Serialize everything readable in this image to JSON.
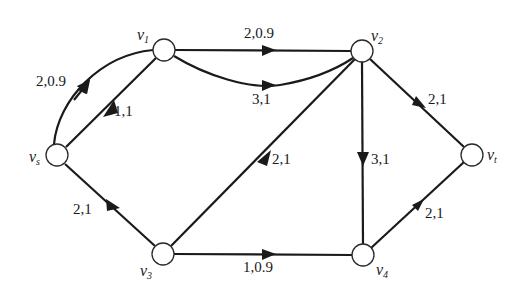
{
  "graph": {
    "type": "directed-network",
    "nodes": [
      {
        "id": "vs",
        "label": "v",
        "sub": "s"
      },
      {
        "id": "v1",
        "label": "v",
        "sub": "1"
      },
      {
        "id": "v2",
        "label": "v",
        "sub": "2"
      },
      {
        "id": "v3",
        "label": "v",
        "sub": "3"
      },
      {
        "id": "v4",
        "label": "v",
        "sub": "4"
      },
      {
        "id": "vt",
        "label": "v",
        "sub": "t"
      }
    ],
    "edges": [
      {
        "from": "vs",
        "to": "v1",
        "label": "2,0.9",
        "curved": true
      },
      {
        "from": "vs",
        "to": "v1",
        "label": "1,1"
      },
      {
        "from": "vs",
        "to": "v3",
        "label": "2,1"
      },
      {
        "from": "v1",
        "to": "v2",
        "label": "2,0.9"
      },
      {
        "from": "v1",
        "to": "v2",
        "label": "3,1",
        "curved": true
      },
      {
        "from": "v2",
        "to": "v3",
        "label": "2,1"
      },
      {
        "from": "v2",
        "to": "v4",
        "label": "3,1"
      },
      {
        "from": "v2",
        "to": "vt",
        "label": "2,1"
      },
      {
        "from": "v3",
        "to": "v4",
        "label": "1,0.9"
      },
      {
        "from": "v4",
        "to": "vt",
        "label": "2,1"
      }
    ]
  }
}
